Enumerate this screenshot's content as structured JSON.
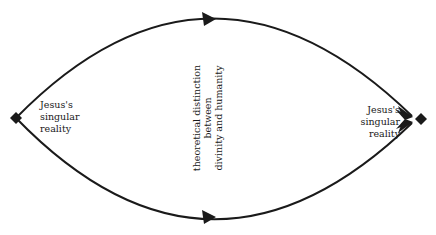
{
  "diagram": {
    "left_node": {
      "lines": [
        "Jesus's",
        "singular",
        "reality"
      ]
    },
    "right_node": {
      "lines": [
        "Jesus's",
        "singular",
        "reality"
      ]
    },
    "center": {
      "lines": [
        "theoretical distinction",
        "between",
        "divinity and humanity"
      ]
    },
    "colors": {
      "stroke": "#1a1a1a",
      "background": "#ffffff"
    },
    "edges": [
      {
        "from": "left_node",
        "to": "right_node",
        "path": "upper-arc",
        "arrow": "midpoint"
      },
      {
        "from": "left_node",
        "to": "right_node",
        "path": "lower-arc",
        "arrow": "midpoint"
      }
    ]
  }
}
